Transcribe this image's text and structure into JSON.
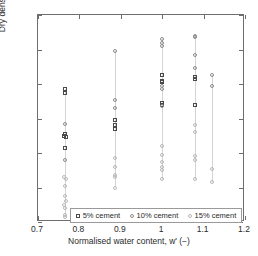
{
  "chart_data": {
    "type": "scatter",
    "title": "",
    "xlabel": "Normalised water content, w' (−)",
    "ylabel": "Dry density (kg/m3)",
    "ylabel_text": "Dry density (kg/m",
    "ylabel_sup": "3",
    "ylabel_tail": ")",
    "xlim": [
      0.7,
      1.2
    ],
    "ylim": [
      2000,
      2120
    ],
    "xticks": [
      0.7,
      0.8,
      0.9,
      1.0,
      1.1,
      1.2
    ],
    "xticklabels": [
      "0.7",
      "0.8",
      "0.9",
      "1",
      "1.1",
      "1.2"
    ],
    "yticks": [
      2000,
      2020,
      2040,
      2060,
      2080,
      2100,
      2120
    ],
    "yticklabels": [
      "2000",
      "2020",
      "2040",
      "2060",
      "2080",
      "2100",
      "2120"
    ],
    "grid": false,
    "legend_position": "lower center",
    "series": [
      {
        "name": "5% cement",
        "marker": "square",
        "color": "#4a4a4a",
        "points": [
          {
            "x": 0.765,
            "y": 2077
          },
          {
            "x": 0.765,
            "y": 2075
          },
          {
            "x": 0.765,
            "y": 2051
          },
          {
            "x": 0.762,
            "y": 2050
          },
          {
            "x": 0.768,
            "y": 2049
          },
          {
            "x": 0.765,
            "y": 2043
          },
          {
            "x": 0.885,
            "y": 2059
          },
          {
            "x": 0.885,
            "y": 2056
          },
          {
            "x": 0.885,
            "y": 2054
          },
          {
            "x": 1.0,
            "y": 2085
          },
          {
            "x": 1.0,
            "y": 2082
          },
          {
            "x": 1.0,
            "y": 2081
          },
          {
            "x": 1.0,
            "y": 2069
          },
          {
            "x": 1.0,
            "y": 2068
          },
          {
            "x": 1.08,
            "y": 2084
          },
          {
            "x": 1.08,
            "y": 2083
          },
          {
            "x": 1.08,
            "y": 2068
          }
        ]
      },
      {
        "name": "10% cement",
        "marker": "circle",
        "color": "#8d8d8d",
        "points": [
          {
            "x": 0.765,
            "y": 2057
          },
          {
            "x": 0.765,
            "y": 2036
          },
          {
            "x": 0.885,
            "y": 2099
          },
          {
            "x": 0.885,
            "y": 2071
          },
          {
            "x": 0.885,
            "y": 2066
          },
          {
            "x": 1.0,
            "y": 2106
          },
          {
            "x": 1.0,
            "y": 2104
          },
          {
            "x": 1.0,
            "y": 2102
          },
          {
            "x": 1.0,
            "y": 2079
          },
          {
            "x": 1.0,
            "y": 2077
          },
          {
            "x": 1.0,
            "y": 2067
          },
          {
            "x": 1.08,
            "y": 2108
          },
          {
            "x": 1.08,
            "y": 2107
          },
          {
            "x": 1.08,
            "y": 2097
          },
          {
            "x": 1.08,
            "y": 2089
          },
          {
            "x": 1.12,
            "y": 2085
          },
          {
            "x": 1.12,
            "y": 2079
          }
        ]
      },
      {
        "name": "15% cement",
        "marker": "circle",
        "color": "#b9b9b9",
        "points": [
          {
            "x": 0.762,
            "y": 2026
          },
          {
            "x": 0.768,
            "y": 2025
          },
          {
            "x": 0.765,
            "y": 2021
          },
          {
            "x": 0.765,
            "y": 2015
          },
          {
            "x": 0.768,
            "y": 2012
          },
          {
            "x": 0.762,
            "y": 2010
          },
          {
            "x": 0.765,
            "y": 2008
          },
          {
            "x": 0.765,
            "y": 2004
          },
          {
            "x": 0.765,
            "y": 2003
          },
          {
            "x": 0.885,
            "y": 2037
          },
          {
            "x": 0.885,
            "y": 2032
          },
          {
            "x": 0.885,
            "y": 2027
          },
          {
            "x": 0.885,
            "y": 2026
          },
          {
            "x": 0.885,
            "y": 2020
          },
          {
            "x": 1.0,
            "y": 2044
          },
          {
            "x": 1.0,
            "y": 2039
          },
          {
            "x": 1.0,
            "y": 2035
          },
          {
            "x": 1.0,
            "y": 2032
          },
          {
            "x": 1.0,
            "y": 2030
          },
          {
            "x": 1.0,
            "y": 2025
          },
          {
            "x": 1.08,
            "y": 2056
          },
          {
            "x": 1.08,
            "y": 2052
          },
          {
            "x": 1.08,
            "y": 2038
          },
          {
            "x": 1.08,
            "y": 2036
          },
          {
            "x": 1.08,
            "y": 2025
          },
          {
            "x": 1.12,
            "y": 2031
          },
          {
            "x": 1.12,
            "y": 2023
          }
        ]
      }
    ],
    "stems": [
      {
        "x": 0.765,
        "y0": 2003,
        "y1": 2077
      },
      {
        "x": 0.885,
        "y0": 2020,
        "y1": 2099
      },
      {
        "x": 1.0,
        "y0": 2025,
        "y1": 2106
      },
      {
        "x": 1.08,
        "y0": 2025,
        "y1": 2108
      },
      {
        "x": 1.12,
        "y0": 2023,
        "y1": 2085
      }
    ]
  },
  "legend": {
    "items": [
      {
        "label": "5% cement",
        "marker": "square"
      },
      {
        "label": "10% cement",
        "marker": "circle"
      },
      {
        "label": "15% cement",
        "marker": "circle"
      }
    ]
  }
}
